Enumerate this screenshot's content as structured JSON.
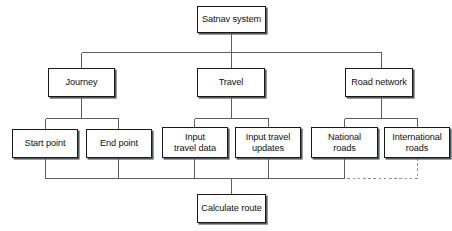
{
  "diagram": {
    "style": {
      "background": "#ffffff",
      "box_fill": "#ffffff",
      "box_border": "#1a1a1a",
      "box_shadow": "#55585c",
      "text_color": "#101010",
      "wire_color": "#5a5d61",
      "dashed_wire_color": "#8b8e92"
    },
    "nodes": [
      {
        "id": "satnav-system",
        "label": "Satnav system",
        "x": 197,
        "y": 6,
        "w": 69,
        "h": 27
      },
      {
        "id": "journey",
        "label": "Journey",
        "x": 48,
        "y": 68,
        "w": 67,
        "h": 29
      },
      {
        "id": "travel",
        "label": "Travel",
        "x": 197,
        "y": 68,
        "w": 68,
        "h": 29
      },
      {
        "id": "road-network",
        "label": "Road network",
        "x": 345,
        "y": 68,
        "w": 68,
        "h": 29
      },
      {
        "id": "start-point",
        "label": "Start point",
        "x": 12,
        "y": 129,
        "w": 66,
        "h": 29
      },
      {
        "id": "end-point",
        "label": "End point",
        "x": 86,
        "y": 129,
        "w": 66,
        "h": 29
      },
      {
        "id": "input-travel-data",
        "label": "Input\ntravel data",
        "x": 162,
        "y": 127,
        "w": 66,
        "h": 31
      },
      {
        "id": "input-travel-updates",
        "label": "Input travel\nupdates",
        "x": 235,
        "y": 127,
        "w": 66,
        "h": 31
      },
      {
        "id": "national-roads",
        "label": "National\nroads",
        "x": 311,
        "y": 127,
        "w": 67,
        "h": 31
      },
      {
        "id": "international-roads",
        "label": "International\nroads",
        "x": 384,
        "y": 127,
        "w": 66,
        "h": 31
      },
      {
        "id": "calculate-route",
        "label": "Calculate route",
        "x": 197,
        "y": 194,
        "w": 69,
        "h": 29
      }
    ],
    "connections": [
      {
        "from": "satnav-system",
        "to": "journey",
        "style": "solid"
      },
      {
        "from": "satnav-system",
        "to": "travel",
        "style": "solid"
      },
      {
        "from": "satnav-system",
        "to": "road-network",
        "style": "solid"
      },
      {
        "from": "journey",
        "to": "start-point",
        "style": "solid"
      },
      {
        "from": "journey",
        "to": "end-point",
        "style": "solid"
      },
      {
        "from": "travel",
        "to": "input-travel-data",
        "style": "solid"
      },
      {
        "from": "travel",
        "to": "input-travel-updates",
        "style": "solid"
      },
      {
        "from": "road-network",
        "to": "national-roads",
        "style": "solid"
      },
      {
        "from": "road-network",
        "to": "international-roads",
        "style": "solid"
      },
      {
        "from": "start-point",
        "to": "calculate-route",
        "style": "solid"
      },
      {
        "from": "end-point",
        "to": "calculate-route",
        "style": "solid"
      },
      {
        "from": "input-travel-data",
        "to": "calculate-route",
        "style": "solid"
      },
      {
        "from": "input-travel-updates",
        "to": "calculate-route",
        "style": "solid"
      },
      {
        "from": "national-roads",
        "to": "calculate-route",
        "style": "solid"
      },
      {
        "from": "international-roads",
        "to": "calculate-route",
        "style": "dashed"
      }
    ]
  }
}
